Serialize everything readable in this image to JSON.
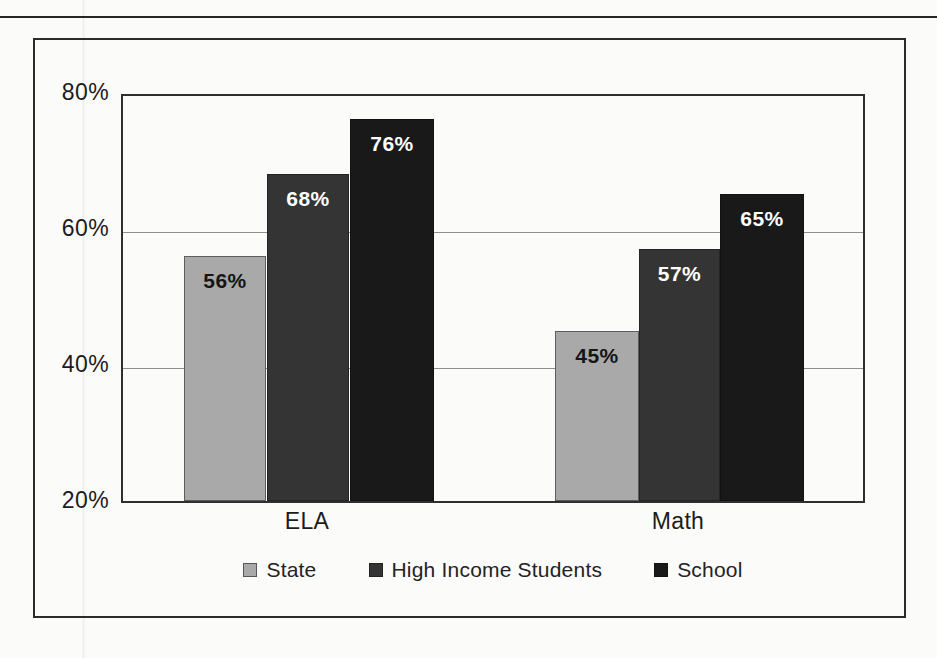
{
  "chart_data": {
    "type": "bar",
    "title": "",
    "subtitle": "",
    "xlabel": "",
    "ylabel": "",
    "categories": [
      "ELA",
      "Math"
    ],
    "series": [
      {
        "name": "State",
        "values": [
          56,
          45
        ],
        "labels": [
          "56%",
          "45%"
        ],
        "color": "#a9a9a9"
      },
      {
        "name": "High Income Students",
        "values": [
          68,
          57
        ],
        "labels": [
          "68%",
          "57%"
        ],
        "color": "#343434"
      },
      {
        "name": "School",
        "values": [
          76,
          65
        ],
        "labels": [
          "65%",
          "65%"
        ],
        "color": "#191919"
      }
    ],
    "ylim": [
      20,
      80
    ],
    "ytick_labels": [
      "80%",
      "60%",
      "40%",
      "20%"
    ],
    "ytick_values": [
      80,
      60,
      40,
      20
    ],
    "grid": true,
    "grid_axis": "y",
    "legend_position": "bottom",
    "value_labels_inside_bars": true
  },
  "axis": {
    "y_ticks": [
      {
        "label": "80%",
        "value": 80
      },
      {
        "label": "60%",
        "value": 60
      },
      {
        "label": "40%",
        "value": 40
      },
      {
        "label": "20%",
        "value": 20
      }
    ],
    "x_ticks": [
      {
        "label": "ELA"
      },
      {
        "label": "Math"
      }
    ]
  },
  "bars": [
    {
      "group": "ELA",
      "series": "State",
      "value": 56,
      "label": "56%",
      "style": "bar-state",
      "left": 61,
      "width": 82,
      "height": 245
    },
    {
      "group": "ELA",
      "series": "High Income Students",
      "value": 68,
      "label": "68%",
      "style": "bar-highincome",
      "left": 144,
      "width": 82,
      "height": 327
    },
    {
      "group": "ELA",
      "series": "School",
      "value": 76,
      "label": "76%",
      "style": "bar-school",
      "left": 227,
      "width": 84,
      "height": 382
    },
    {
      "group": "Math",
      "series": "State",
      "value": 45,
      "label": "45%",
      "style": "bar-state",
      "left": 432,
      "width": 84,
      "height": 170
    },
    {
      "group": "Math",
      "series": "High Income Students",
      "value": 57,
      "label": "57%",
      "style": "bar-highincome",
      "left": 516,
      "width": 81,
      "height": 252
    },
    {
      "group": "Math",
      "series": "School",
      "value": 65,
      "label": "65%",
      "style": "bar-school",
      "left": 597,
      "width": 84,
      "height": 307
    }
  ],
  "group_label_positions": [
    {
      "label": "ELA",
      "center": 186
    },
    {
      "label": "Math",
      "center": 557
    }
  ],
  "legend": {
    "items": [
      {
        "label": "State",
        "swatch": "sw-state",
        "color": "#a9a9a9"
      },
      {
        "label": "High Income Students",
        "swatch": "sw-highincome",
        "color": "#343434"
      },
      {
        "label": "School",
        "swatch": "sw-school",
        "color": "#191919"
      }
    ]
  },
  "colors": {
    "state": "#a9a9a9",
    "high_income": "#343434",
    "school": "#191919",
    "frame": "#2b2b2b",
    "gridline": "#8f8f8f",
    "text": "#1c1c1c",
    "page_background": "#fbfbfa"
  }
}
